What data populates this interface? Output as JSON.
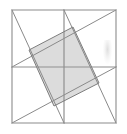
{
  "figure": {
    "title": "Square with pinwheel cevians and shaded inner quadrilateral",
    "canvas": {
      "width": 127,
      "height": 134,
      "background_color": "#ffffff"
    },
    "colors": {
      "outline_stroke": "#8c8c8c",
      "line_stroke": "#8a8a8a",
      "midline_stroke": "#8f8f8f",
      "shaded_fill": "#d6d6d6",
      "shaded_stroke": "#7d7d7d",
      "smudge": "#cfcfcf"
    },
    "outer_square": {
      "name": "outer-square",
      "points": [
        {
          "label": "A",
          "x": 12,
          "y": 10
        },
        {
          "label": "B",
          "x": 116,
          "y": 10
        },
        {
          "label": "C",
          "x": 116,
          "y": 123
        },
        {
          "label": "D",
          "x": 12,
          "y": 123
        }
      ],
      "stroke_width": 1.1
    },
    "midlines": [
      {
        "name": "horizontal-midline",
        "orientation": "horizontal",
        "x1": 12,
        "y1": 67,
        "x2": 116,
        "y2": 67,
        "stroke_width": 1.2
      },
      {
        "name": "vertical-midline",
        "orientation": "vertical",
        "x1": 64,
        "y1": 10,
        "x2": 64,
        "y2": 123,
        "stroke_width": 1.2
      }
    ],
    "cevians": [
      {
        "name": "cevian-top-left-to-bottom-mid",
        "from": {
          "x": 12,
          "y": 10
        },
        "to": {
          "x": 64,
          "y": 123
        },
        "stroke_width": 1.0
      },
      {
        "name": "cevian-top-right-to-left-mid",
        "from": {
          "x": 116,
          "y": 10
        },
        "to": {
          "x": 12,
          "y": 67
        },
        "stroke_width": 1.0
      },
      {
        "name": "cevian-bottom-right-to-top-mid",
        "from": {
          "x": 116,
          "y": 123
        },
        "to": {
          "x": 64,
          "y": 10
        },
        "stroke_width": 1.0
      },
      {
        "name": "cevian-bottom-left-to-right-mid",
        "from": {
          "x": 12,
          "y": 123
        },
        "to": {
          "x": 116,
          "y": 67
        },
        "stroke_width": 1.0
      }
    ],
    "shaded_quadrilateral": {
      "name": "inner-shaded-square",
      "points": [
        {
          "label": "P",
          "x": 73,
          "y": 27
        },
        {
          "label": "Q",
          "x": 99,
          "y": 83
        },
        {
          "label": "R",
          "x": 54,
          "y": 106
        },
        {
          "label": "S",
          "x": 29,
          "y": 50
        }
      ],
      "fill": "#d6d6d6",
      "fill_opacity": 0.85,
      "stroke_width": 1.0
    },
    "artifact": {
      "name": "scan-smudge",
      "x": 103,
      "y": 40,
      "width": 9,
      "height": 24
    }
  }
}
